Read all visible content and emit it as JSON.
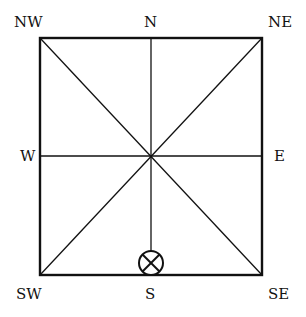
{
  "diagram": {
    "type": "compass-direction-square",
    "labels": {
      "nw": "NW",
      "n": "N",
      "ne": "NE",
      "w": "W",
      "e": "E",
      "sw": "SW",
      "s": "S",
      "se": "SE"
    },
    "marker": {
      "symbol": "circled-x",
      "position": "S"
    },
    "colors": {
      "line": "#111111",
      "background": "#ffffff"
    }
  }
}
